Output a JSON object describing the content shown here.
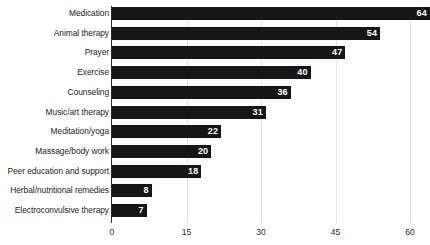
{
  "chart_data": {
    "type": "bar",
    "orientation": "horizontal",
    "title": "",
    "xlabel": "",
    "ylabel": "",
    "xlim": [
      0,
      60
    ],
    "xticks": [
      0,
      15,
      30,
      45,
      60
    ],
    "xtick_labels": [
      "0",
      "15",
      "30",
      "45",
      "60"
    ],
    "grid": true,
    "grid_axis": "x",
    "legend": false,
    "bar_color": "#161616",
    "value_label_color": "#ffffff",
    "gridline_color": "#e6e6e6",
    "categories": [
      "Medication",
      "Animal therapy",
      "Prayer",
      "Exercise",
      "Counseling",
      "Music/art therapy",
      "Meditation/yoga",
      "Massage/body work",
      "Peer education and support",
      "Herbal/nutritional remedies",
      "Electroconvulsive therapy"
    ],
    "values": [
      64,
      54,
      47,
      40,
      36,
      31,
      22,
      20,
      18,
      8,
      7
    ],
    "value_labels": [
      "64",
      "54",
      "47",
      "40",
      "36",
      "31",
      "22",
      "20",
      "18",
      "8",
      "7"
    ]
  }
}
